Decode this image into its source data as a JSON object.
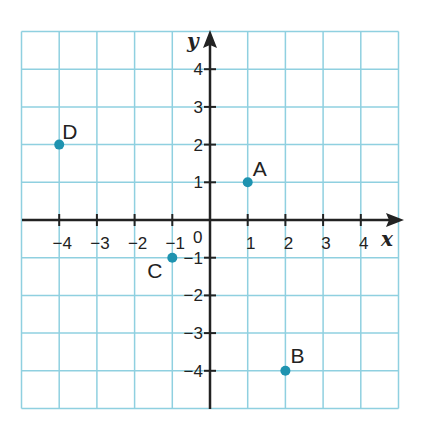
{
  "chart_data": {
    "type": "scatter",
    "title": "",
    "xlabel": "x",
    "ylabel": "y",
    "xlim": [
      -5,
      5
    ],
    "ylim": [
      -5,
      5
    ],
    "grid": true,
    "x_ticks": [
      "-4",
      "-3",
      "-2",
      "-1",
      "1",
      "2",
      "3",
      "4"
    ],
    "y_ticks": [
      "4",
      "3",
      "2",
      "1",
      "-1",
      "-2",
      "-3",
      "-4"
    ],
    "origin_label": "0",
    "points": [
      {
        "label": "A",
        "x": 1,
        "y": 1
      },
      {
        "label": "B",
        "x": 2,
        "y": -4
      },
      {
        "label": "C",
        "x": -1,
        "y": -1
      },
      {
        "label": "D",
        "x": -4,
        "y": 2
      }
    ]
  },
  "colors": {
    "grid": "#8fd0e0",
    "axis": "#222222",
    "point": "#1e93b0"
  }
}
